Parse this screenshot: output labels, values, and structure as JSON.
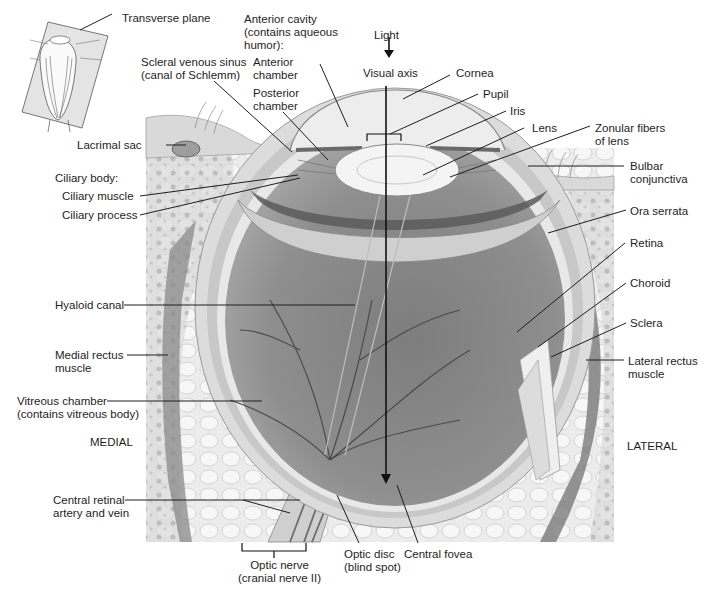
{
  "figure": {
    "title_fragment": ""
  },
  "inset": {
    "label": "Transverse plane"
  },
  "orientation": {
    "medial": "MEDIAL",
    "lateral": "LATERAL"
  },
  "light": {
    "label": "Light",
    "axis_label": "Visual axis"
  },
  "labels_left": {
    "lacrimal_sac": "Lacrimal sac",
    "ciliary_body": "Ciliary body:",
    "ciliary_muscle": "Ciliary muscle",
    "ciliary_process": "Ciliary process",
    "hyaloid_canal": "Hyaloid canal",
    "medial_rectus": "Medial rectus\nmuscle",
    "vitreous_chamber": "Vitreous chamber\n(contains vitreous body)",
    "central_retinal": "Central retinal\nartery and vein"
  },
  "labels_top": {
    "anterior_cavity": "Anterior cavity\n(contains aqueous\nhumor):",
    "anterior_chamber": "Anterior\nchamber",
    "posterior_chamber": "Posterior\nchamber",
    "scleral_sinus": "Scleral venous sinus\n(canal of Schlemm)"
  },
  "labels_right": {
    "cornea": "Cornea",
    "pupil": "Pupil",
    "iris": "Iris",
    "lens": "Lens",
    "zonular": "Zonular fibers\nof lens",
    "bulbar": "Bulbar\nconjunctiva",
    "ora_serrata": "Ora serrata",
    "retina": "Retina",
    "choroid": "Choroid",
    "sclera": "Sclera",
    "lateral_rectus": "Lateral rectus\nmuscle"
  },
  "labels_bottom": {
    "optic_nerve": "Optic nerve\n(cranial nerve II)",
    "optic_disc": "Optic disc\n(blind spot)",
    "central_fovea": "Central fovea"
  },
  "colors": {
    "background": "#ffffff",
    "tissue_light": "#e6e6e6",
    "tissue_mid": "#bdbdbd",
    "vitreous": "#8a8a8a",
    "muscle": "#7a7a7a",
    "leader_line": "#1e1e1e"
  }
}
